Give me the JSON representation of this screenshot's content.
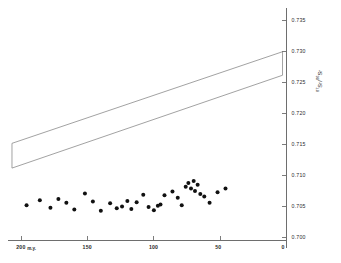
{
  "figure": {
    "background": "#ffffff",
    "axis_color": "#6e6e6e",
    "point_color": "#111111",
    "band_color": "#8a8a8a"
  },
  "axis_title": {
    "numerator_sup": "87",
    "numerator": "Sr",
    "slash": "/",
    "denominator_sup": "86",
    "denominator": "Sr"
  },
  "chart_data": {
    "type": "scatter",
    "title": "",
    "xlabel": "m.y.",
    "ylabel": "87Sr/86Sr",
    "xlim": [
      210,
      0
    ],
    "ylim": [
      0.6995,
      0.7365
    ],
    "x_reversed": true,
    "grid": false,
    "legend": null,
    "x_ticks": [
      200,
      150,
      100,
      50,
      0
    ],
    "x_tick_labels": [
      "200",
      "150",
      "100",
      "50",
      "0"
    ],
    "x_unit_label": "m.y.",
    "y_ticks": [
      0.7,
      0.705,
      0.71,
      0.715,
      0.72,
      0.725,
      0.73,
      0.735
    ],
    "y_tick_labels": [
      "0.700",
      "0.705",
      "0.710",
      "0.715",
      "0.720",
      "0.725",
      "0.730",
      "0.735"
    ],
    "series": [
      {
        "name": "samples",
        "marker": "filled-circle",
        "color": "#111111",
        "points": [
          [
            196,
            0.7052
          ],
          [
            186,
            0.706
          ],
          [
            178,
            0.7048
          ],
          [
            172,
            0.7062
          ],
          [
            166,
            0.7056
          ],
          [
            160,
            0.7045
          ],
          [
            152,
            0.7071
          ],
          [
            146,
            0.7058
          ],
          [
            140,
            0.7043
          ],
          [
            133,
            0.7055
          ],
          [
            128,
            0.7047
          ],
          [
            124,
            0.705
          ],
          [
            120,
            0.7059
          ],
          [
            117,
            0.7046
          ],
          [
            113,
            0.7057
          ],
          [
            108,
            0.7069
          ],
          [
            104,
            0.7049
          ],
          [
            100,
            0.7044
          ],
          [
            97,
            0.7051
          ],
          [
            95,
            0.7053
          ],
          [
            92,
            0.7068
          ],
          [
            86,
            0.7074
          ],
          [
            82,
            0.7064
          ],
          [
            79,
            0.7052
          ],
          [
            76,
            0.7082
          ],
          [
            74,
            0.7088
          ],
          [
            72,
            0.7079
          ],
          [
            70,
            0.7091
          ],
          [
            69,
            0.7075
          ],
          [
            67,
            0.7085
          ],
          [
            65,
            0.707
          ],
          [
            62,
            0.7066
          ],
          [
            58,
            0.7056
          ],
          [
            52,
            0.7073
          ],
          [
            46,
            0.7079
          ]
        ]
      }
    ],
    "band": {
      "name": "mantle-evolution-band",
      "style": "vertical-hatch",
      "outline_color": "#8a8a8a",
      "hatch_color": "#9a9a9a",
      "vertices_data": [
        [
          207,
          0.7152
        ],
        [
          3,
          0.73
        ],
        [
          3,
          0.7262
        ],
        [
          207,
          0.7112
        ]
      ]
    }
  }
}
